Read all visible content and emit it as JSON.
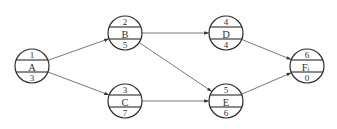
{
  "diagram": {
    "type": "activity-network",
    "nodes": [
      {
        "id": "A",
        "label": "A",
        "sub": "",
        "top": "1",
        "bottom": "3",
        "cx": 32,
        "cy": 66
      },
      {
        "id": "B",
        "label": "B",
        "sub": "",
        "top": "2",
        "bottom": "5",
        "cx": 125,
        "cy": 33
      },
      {
        "id": "C",
        "label": "C",
        "sub": "",
        "top": "3",
        "bottom": "7",
        "cx": 125,
        "cy": 101
      },
      {
        "id": "D",
        "label": "D",
        "sub": "",
        "top": "4",
        "bottom": "4",
        "cx": 226,
        "cy": 33
      },
      {
        "id": "E",
        "label": "E",
        "sub": "",
        "top": "5",
        "bottom": "6",
        "cx": 226,
        "cy": 101
      },
      {
        "id": "F",
        "label": "F",
        "sub": "i",
        "top": "6",
        "bottom": "0",
        "cx": 307,
        "cy": 66
      }
    ],
    "edges": [
      {
        "from": "A",
        "to": "B"
      },
      {
        "from": "A",
        "to": "C"
      },
      {
        "from": "B",
        "to": "D"
      },
      {
        "from": "B",
        "to": "E"
      },
      {
        "from": "C",
        "to": "E"
      },
      {
        "from": "D",
        "to": "F"
      },
      {
        "from": "E",
        "to": "F"
      }
    ],
    "colors": {
      "stroke": "#2a2a2a",
      "edge": "#555555",
      "text": "#333333"
    }
  }
}
